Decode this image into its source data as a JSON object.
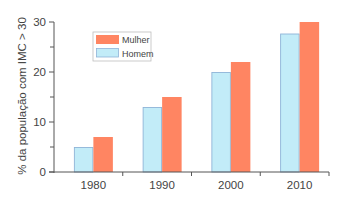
{
  "chart_data": {
    "type": "bar",
    "title": "",
    "xlabel": "",
    "ylabel": "% da população com IMC > 30",
    "categories": [
      "1980",
      "1990",
      "2000",
      "2010"
    ],
    "series": [
      {
        "name": "Homem",
        "color": "#c2ecf8",
        "border": "#8fb4d8",
        "values": [
          5,
          13,
          20,
          27.7
        ]
      },
      {
        "name": "Mulher",
        "color": "#ff8562",
        "border": "#ff8562",
        "values": [
          7,
          15,
          22,
          30
        ]
      }
    ],
    "ylim": [
      0,
      30
    ],
    "yticks": [
      0,
      10,
      20,
      30
    ],
    "yticks_minor": [
      5,
      15,
      25
    ],
    "grid": false,
    "legend_position": "upper-left-inside",
    "legend": [
      {
        "label": "Mulher",
        "color": "#ff8562"
      },
      {
        "label": "Homem",
        "color": "#c2ecf8"
      }
    ]
  }
}
